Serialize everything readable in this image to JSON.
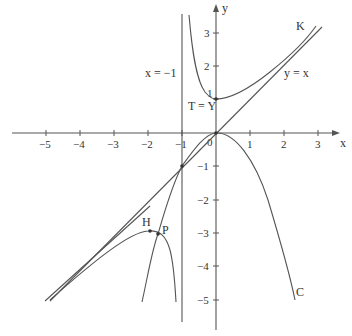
{
  "diagram": {
    "axes": {
      "x_label": "x",
      "y_label": "y",
      "origin_label": "0",
      "x_ticks": [
        "−5",
        "−4",
        "−3",
        "−2",
        "−1",
        "1",
        "2",
        "3"
      ],
      "y_ticks": [
        "3",
        "2",
        "1",
        "−1",
        "−2",
        "−3",
        "−4",
        "−5"
      ]
    },
    "labels": {
      "asymptote": "x = −1",
      "diagonal": "y = x",
      "curve_k": "K",
      "curve_c": "C",
      "point_t": "T = Y",
      "point_h": "H",
      "point_p": "P"
    },
    "colors": {
      "stroke": "#555555",
      "text": "#333333",
      "background": "#ffffff"
    }
  }
}
